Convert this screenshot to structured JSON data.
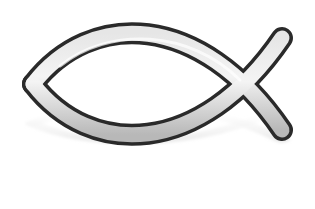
{
  "image": {
    "subject": "ichthys-fish-symbol",
    "has_reflection": true,
    "colors": {
      "background": "#ffffff",
      "outline": "#2a2a2a",
      "fill": "#c8c8c8",
      "highlight": "#f2f2f2",
      "reflection": "#d9d9d9"
    }
  }
}
